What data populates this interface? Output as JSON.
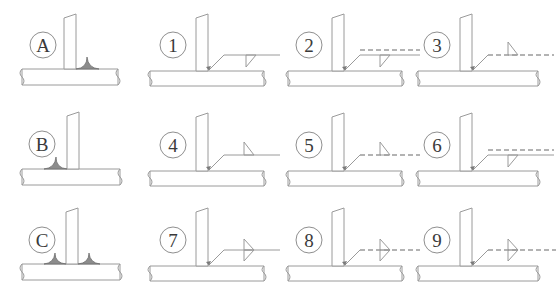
{
  "figure": {
    "type": "welding-symbol-reference-chart",
    "rows": 3,
    "columns": 4,
    "colors": {
      "line": "#9a9a9a",
      "line_dark": "#6f6f6f",
      "weld_fill": "#8c8c8c",
      "label_text": "#3a3a3a",
      "background": "#ffffff"
    }
  },
  "cells": [
    {
      "id": "A",
      "label": "A",
      "kind": "joint-view",
      "row": 1,
      "column": 1,
      "weld_sides": [
        "right"
      ],
      "description": "T-joint with single fillet weld on right side of vertical plate"
    },
    {
      "id": "1",
      "label": "1",
      "kind": "symbol",
      "row": 1,
      "column": 2,
      "reference_line": "solid",
      "identification_line": "none",
      "triangle_position": "below",
      "triangle_count": 1,
      "description": "Solid reference line, fillet triangle below the line"
    },
    {
      "id": "2",
      "label": "2",
      "kind": "symbol",
      "row": 1,
      "column": 3,
      "reference_line": "solid",
      "identification_line": "dashed-above",
      "triangle_position": "below",
      "triangle_count": 1,
      "description": "Solid reference line with dashed identification line above, triangle below"
    },
    {
      "id": "3",
      "label": "3",
      "kind": "symbol",
      "row": 1,
      "column": 4,
      "reference_line": "dashed",
      "identification_line": "none",
      "triangle_position": "above",
      "triangle_count": 1,
      "description": "Dashed identification line, fillet triangle above the line"
    },
    {
      "id": "B",
      "label": "B",
      "kind": "joint-view",
      "row": 2,
      "column": 1,
      "weld_sides": [
        "left"
      ],
      "description": "T-joint with single fillet weld on left side of vertical plate"
    },
    {
      "id": "4",
      "label": "4",
      "kind": "symbol",
      "row": 2,
      "column": 2,
      "reference_line": "solid",
      "identification_line": "none",
      "triangle_position": "above",
      "triangle_count": 1,
      "description": "Solid reference line, fillet triangle above the line"
    },
    {
      "id": "5",
      "label": "5",
      "kind": "symbol",
      "row": 2,
      "column": 3,
      "reference_line": "dashed",
      "identification_line": "none",
      "triangle_position": "above",
      "triangle_count": 1,
      "description": "Dashed identification line, fillet triangle above the line"
    },
    {
      "id": "6",
      "label": "6",
      "kind": "symbol",
      "row": 2,
      "column": 4,
      "reference_line": "solid",
      "identification_line": "dashed-above",
      "triangle_position": "below",
      "triangle_count": 1,
      "description": "Solid reference line with dashed identification line above, triangle below"
    },
    {
      "id": "C",
      "label": "C",
      "kind": "joint-view",
      "row": 3,
      "column": 1,
      "weld_sides": [
        "left",
        "right"
      ],
      "description": "T-joint with double fillet welds on both sides of vertical plate"
    },
    {
      "id": "7",
      "label": "7",
      "kind": "symbol",
      "row": 3,
      "column": 2,
      "reference_line": "solid",
      "identification_line": "none",
      "triangle_position": "both",
      "triangle_count": 2,
      "description": "Solid reference line with double fillet triangles above and below"
    },
    {
      "id": "8",
      "label": "8",
      "kind": "symbol",
      "row": 3,
      "column": 3,
      "reference_line": "dashed",
      "identification_line": "none",
      "triangle_position": "both",
      "triangle_count": 2,
      "description": "Dashed identification line with double fillet triangles above and below"
    },
    {
      "id": "9",
      "label": "9",
      "kind": "symbol",
      "row": 3,
      "column": 4,
      "reference_line": "dashed",
      "identification_line": "none",
      "triangle_position": "both",
      "triangle_count": 2,
      "description": "Dashed identification line with double fillet triangles above and below"
    }
  ]
}
